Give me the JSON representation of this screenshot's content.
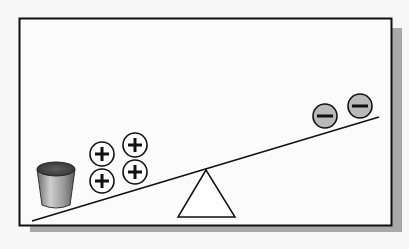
{
  "diagram": {
    "colors": {
      "background": "#f7f7f7",
      "panel": "#fbfbfb",
      "border": "#111111",
      "shadow": "#a8a8a8",
      "positive_fill": "#ffffff",
      "negative_fill": "#b9b9b9",
      "stroke": "#111111"
    },
    "positive_charges": [
      {
        "cx": 102,
        "cy": 154,
        "symbol": "+"
      },
      {
        "cx": 135,
        "cy": 145,
        "symbol": "+"
      },
      {
        "cx": 102,
        "cy": 181,
        "symbol": "+"
      },
      {
        "cx": 135,
        "cy": 172,
        "symbol": "+"
      }
    ],
    "negative_charges": [
      {
        "cx": 325,
        "cy": 116,
        "symbol": "−"
      },
      {
        "cx": 360,
        "cy": 106,
        "symbol": "−"
      }
    ],
    "icons": {
      "bucket": "bucket-icon",
      "fulcrum": "triangle-fulcrum-icon",
      "plank": "seesaw-plank"
    }
  }
}
